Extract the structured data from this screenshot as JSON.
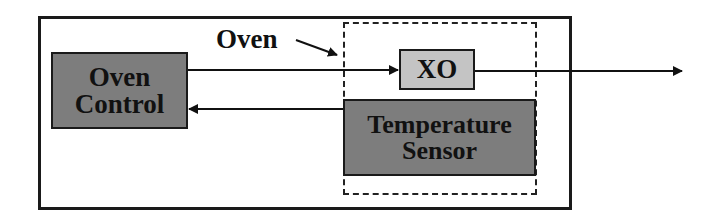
{
  "diagram": {
    "blocks": {
      "oven_control": {
        "line1": "Oven",
        "line2": "Control"
      },
      "xo": {
        "label": "XO"
      },
      "temperature_sensor": {
        "line1": "Temperature",
        "line2": "Sensor"
      }
    },
    "annotations": {
      "oven_label": "Oven"
    },
    "colors": {
      "dark_block": "#7d7d7d",
      "light_block": "#c4c4c4",
      "line": "#111111"
    }
  }
}
